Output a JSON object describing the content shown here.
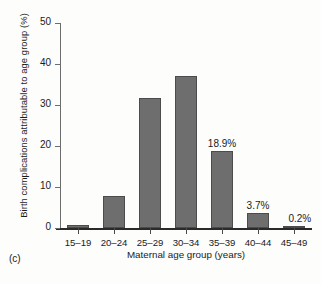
{
  "panel": {
    "tag": "(c)"
  },
  "chart_data": {
    "type": "bar",
    "title": "",
    "subtitle": "",
    "xlabel": "Maternal age group (years)",
    "ylabel": "Birth complications attributable to age group (%)",
    "categories": [
      "15–19",
      "20–24",
      "25–29",
      "30–34",
      "35–39",
      "40–44",
      "45–49"
    ],
    "values": [
      0.8,
      7.8,
      31.7,
      37.1,
      18.9,
      3.7,
      0.2
    ],
    "point_labels": [
      "",
      "",
      "",
      "",
      "18.9%",
      "3.7%",
      "0.2%"
    ],
    "ylim": [
      0,
      50
    ],
    "yticks": [
      0,
      10,
      20,
      30,
      40,
      50
    ],
    "ytick_labels": [
      "0",
      "10",
      "20",
      "30",
      "40",
      "50"
    ],
    "grid": false,
    "legend": false,
    "legend_position": "none",
    "bar_color": "#6e6e6e",
    "bar_edge_color": "#4c4c4c",
    "axis_color": "#2a2a2a",
    "background_color": "#fdfdfb"
  }
}
